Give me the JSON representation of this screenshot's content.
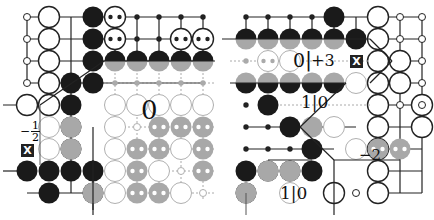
{
  "figure": {
    "colors": {
      "grid": "#222222",
      "grid_faded": "#aaaaaa",
      "black_stone": "#1a1a1a",
      "white_stone_edge": "#222222",
      "gray_stone": "#a8a8a8",
      "faded_white_edge": "#b0b0b0",
      "dot": "#ffffff"
    },
    "spacing": 22
  },
  "left_board": {
    "name": "left-diagram",
    "labels": {
      "main_value": "0",
      "side_value_sign": "−",
      "side_value_num": "1",
      "side_value_den": "2",
      "x_marker": "X"
    }
  },
  "right_board": {
    "name": "right-diagram",
    "labels": {
      "top_value_left": "0",
      "top_value_right": "+3",
      "top_value_sep": "|",
      "middle_value": "1|0",
      "right_value": "−2",
      "bottom_value": "1|0",
      "x_marker": "X"
    }
  }
}
